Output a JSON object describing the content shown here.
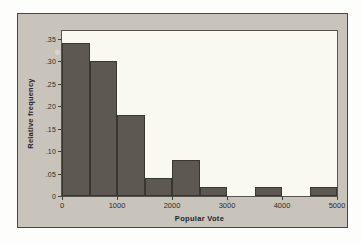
{
  "chart_data": {
    "type": "bar",
    "title": "",
    "xlabel": "Popular Vote",
    "ylabel": "Relative frequency",
    "xlim": [
      0,
      5000
    ],
    "ylim": [
      0,
      0.3667
    ],
    "grid": false,
    "legend": "none",
    "bin_width": 500,
    "bin_starts": [
      0,
      500,
      1000,
      1500,
      2000,
      2500,
      3000,
      3500,
      4000,
      4500
    ],
    "bin_ends": [
      500,
      1000,
      1500,
      2000,
      2500,
      3000,
      3500,
      4000,
      4500,
      5000
    ],
    "categories": [
      "0-500",
      "500-1000",
      "1000-1500",
      "1500-2000",
      "2000-2500",
      "2500-3000",
      "3000-3500",
      "3500-4000",
      "4000-4500",
      "4500-5000"
    ],
    "values": [
      0.34,
      0.3,
      0.18,
      0.04,
      0.08,
      0.02,
      0.0,
      0.02,
      0.0,
      0.02
    ],
    "xticks": [
      0,
      1000,
      2000,
      3000,
      4000,
      5000
    ],
    "xtick_labels": [
      "0",
      "1000",
      "2000",
      "3000",
      "4000",
      "5000"
    ],
    "yticks": [
      0,
      0.05,
      0.1,
      0.15,
      0.2,
      0.25,
      0.3,
      0.35
    ],
    "ytick_labels": [
      "0",
      ".05",
      ".10",
      ".15",
      ".20",
      ".25",
      ".30",
      ".35"
    ],
    "colors": {
      "bar_fill": "#5d5952",
      "bar_edge": "#39362f",
      "plot_background": "#faf9f1",
      "figure_background": "#c8c4bb",
      "axis": "#56524c",
      "text": "#26231f"
    }
  }
}
